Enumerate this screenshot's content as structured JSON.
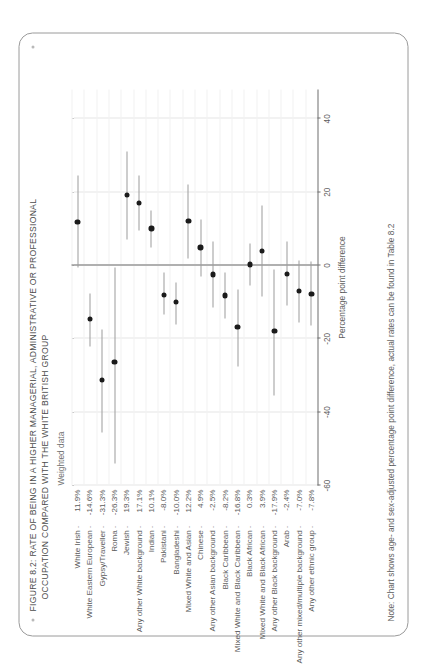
{
  "figure": {
    "title_line_1": "FIGURE 8.2: RATE OF BEING IN A HIGHER MANAGERIAL, ADMINISTRATIVE OR PROFESSIONAL",
    "title_line_2": "OCCUPATION COMPARED WITH THE WHITE BRITISH GROUP",
    "panel_label": "Weighted data",
    "note": "Note: Chart shows age- and sex-adjusted percentage point difference, actual rates can be found in Table 8.2",
    "accent_color": "#1b1b1b",
    "whisker_color": "#9b9b9b",
    "frame_color": "#9a9a9a"
  },
  "chart_data": {
    "type": "scatter",
    "title": "FIGURE 8.2: RATE OF BEING IN A HIGHER MANAGERIAL, ADMINISTRATIVE OR PROFESSIONAL OCCUPATION COMPARED WITH THE WHITE BRITISH GROUP",
    "subtitle": "Weighted data",
    "xlabel": "Percentage point difference",
    "ylabel": "",
    "xlim": [
      -60,
      48
    ],
    "xticks": [
      -60,
      -40,
      -20,
      0,
      20,
      40
    ],
    "xticklabels": [
      "-60",
      "-40",
      "-20",
      "0",
      "20",
      "40"
    ],
    "grid": true,
    "legend": "none",
    "reference_line": 0,
    "categories": [
      "White Irish",
      "White Eastern European",
      "Gypsy/Traveller",
      "Roma",
      "Jewish",
      "Any other White background",
      "Indian",
      "Pakistani",
      "Bangladeshi",
      "Mixed White and Asian",
      "Chinese",
      "Any other Asian background",
      "Black Caribbean",
      "Mixed White and Black Caribbean",
      "Black African",
      "Mixed White and Black African",
      "Any other Black background",
      "Arab",
      "Any other mixed/multiple background",
      "Any other ethnic group"
    ],
    "value_labels": [
      "11.9%",
      "-14.6%",
      "-31.3%",
      "-26.3%",
      "19.3%",
      "17.1%",
      "10.1%",
      "-8.0%",
      "-10.0%",
      "12.2%",
      "4.9%",
      "-2.5%",
      "-8.2%",
      "-16.8%",
      "0.3%",
      "3.9%",
      "-17.9%",
      "-2.4%",
      "-7.0%",
      "-7.8%"
    ],
    "values": [
      11.9,
      -14.6,
      -31.3,
      -26.3,
      19.3,
      17.1,
      10.1,
      -8.0,
      -10.0,
      12.2,
      4.9,
      -2.5,
      -8.2,
      -16.8,
      0.3,
      3.9,
      -17.9,
      -2.4,
      -7.0,
      -7.8
    ],
    "ci_low": [
      -0.5,
      -22.0,
      -45.5,
      -54.0,
      7.0,
      9.5,
      5.0,
      -13.5,
      -16.0,
      2.0,
      -3.0,
      -11.5,
      -14.5,
      -27.5,
      -5.5,
      -8.5,
      -35.5,
      -11.0,
      -15.5,
      -16.5
    ],
    "ci_high": [
      24.5,
      -7.5,
      -17.5,
      -0.5,
      31.0,
      24.5,
      15.0,
      -2.0,
      -4.5,
      22.0,
      12.5,
      6.5,
      -2.0,
      -6.5,
      6.0,
      16.5,
      -1.0,
      6.5,
      1.5,
      1.0
    ]
  }
}
